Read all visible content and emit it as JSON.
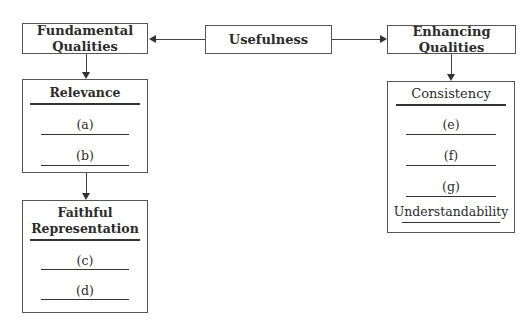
{
  "root": {
    "label": "Usefulness"
  },
  "fundamental": {
    "label": "Fundamental Qualities",
    "line1": "Fundamental",
    "line2": "Qualities",
    "relevance": {
      "title": "Relevance",
      "items": [
        "(a)",
        "(b)"
      ]
    },
    "faithful": {
      "title_line1": "Faithful",
      "title_line2": "Representation",
      "items": [
        "(c)",
        "(d)"
      ]
    }
  },
  "enhancing": {
    "label": "Enhancing Qualities",
    "line1": "Enhancing",
    "line2": "Qualities",
    "items": [
      "Consistency",
      "(e)",
      "(f)",
      "(g)",
      "Understandability"
    ]
  }
}
